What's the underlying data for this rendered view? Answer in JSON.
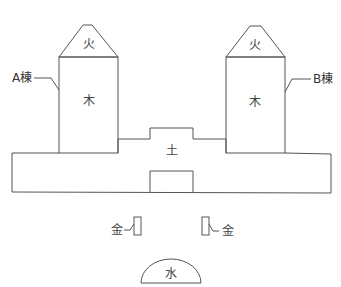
{
  "diagram": {
    "type": "five-elements-building-layout",
    "buildings": [
      {
        "id": "A",
        "label": "A棟",
        "roof_element": "火",
        "body_element": "木"
      },
      {
        "id": "B",
        "label": "B棟",
        "roof_element": "火",
        "body_element": "木"
      }
    ],
    "base": {
      "element": "土"
    },
    "metal_markers": [
      {
        "side": "left",
        "element": "金"
      },
      {
        "side": "right",
        "element": "金"
      }
    ],
    "water": {
      "element": "水"
    },
    "colors": {
      "line": "#555555",
      "text": "#333333",
      "background": "#ffffff"
    }
  }
}
